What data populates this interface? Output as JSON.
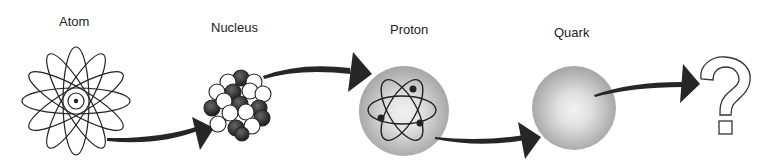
{
  "diagram": {
    "title": "",
    "stages": [
      {
        "id": "atom",
        "label": "Atom",
        "icon": "atom-orbits-icon"
      },
      {
        "id": "nucleus",
        "label": "Nucleus",
        "icon": "nucleus-cluster-icon"
      },
      {
        "id": "proton",
        "label": "Proton",
        "icon": "proton-sphere-icon"
      },
      {
        "id": "quark",
        "label": "Quark",
        "icon": "quark-sphere-icon"
      },
      {
        "id": "unknown",
        "label": "",
        "icon": "question-mark-icon"
      }
    ],
    "arrows": [
      {
        "from": "atom",
        "to": "nucleus"
      },
      {
        "from": "nucleus",
        "to": "proton"
      },
      {
        "from": "proton",
        "to": "quark"
      },
      {
        "from": "quark",
        "to": "unknown"
      }
    ],
    "colors": {
      "ink": "#222222",
      "sphere_gray": "#b8b8b8",
      "sphere_light": "#ececec"
    }
  }
}
